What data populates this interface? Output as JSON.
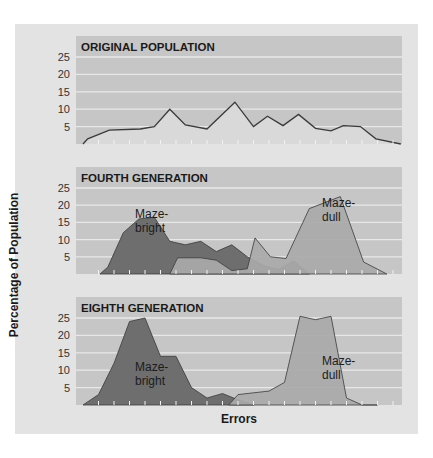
{
  "chart_data": {
    "type": "area",
    "ylabel": "Percentage of Population",
    "xlabel": "Errors",
    "ylim": [
      0,
      25
    ],
    "yticks": [
      5,
      10,
      15,
      20,
      25
    ],
    "grid": true,
    "colors": {
      "card_bg": "#e3e3e3",
      "panel_bg": "#c6c6c6",
      "panel_header_bg": "#c2c2c2",
      "gridline": "#e8e8e8",
      "maze_bright_fill": "#6e6e6e",
      "maze_dull_fill": "#a9a9a9",
      "original_fill": "#d9d9d9",
      "line": "#3a3a3a"
    },
    "panels": [
      {
        "title": "ORIGINAL POPULATION",
        "series": [
          {
            "name": "Original population",
            "style": "line",
            "x": [
              0,
              0.3,
              1.7,
              3.7,
              4.6,
              5.6,
              6.6,
              8,
              9.8,
              11,
              11.9,
              12.9,
              13.9,
              15,
              16,
              16.8,
              17.9,
              18.9,
              20.5
            ],
            "values": [
              0,
              1.5,
              4,
              4.3,
              5,
              10,
              5.5,
              4.3,
              12,
              5,
              8,
              5.3,
              8.5,
              4.5,
              3.8,
              5.3,
              5,
              1.5,
              0
            ]
          }
        ]
      },
      {
        "title": "FOURTH GENERATION",
        "series": [
          {
            "name": "Maze-bright",
            "label_lines": [
              "Maze-",
              "bright"
            ],
            "style": "area",
            "x": [
              1.1,
              1.6,
              2.6,
              3.6,
              4.6,
              5.6,
              6.6,
              7.6,
              8.6,
              9.6,
              10.6,
              11.6,
              12.6,
              13.6,
              14.6
            ],
            "values": [
              0,
              2,
              12,
              16,
              16.5,
              9.5,
              8.5,
              9.5,
              6.5,
              8.5,
              5,
              2.5,
              1.3,
              3.8,
              0
            ]
          },
          {
            "name": "Maze-dull",
            "label_lines": [
              "Maze-",
              "dull"
            ],
            "style": "area",
            "x": [
              5.6,
              6.1,
              7.6,
              8.6,
              9.6,
              10.6,
              11.1,
              12.1,
              13.1,
              14.6,
              16.6,
              18.1,
              19.6
            ],
            "values": [
              0,
              4.7,
              4.7,
              4,
              1,
              1.5,
              10.5,
              5,
              4.5,
              19,
              22.5,
              3.5,
              0
            ]
          }
        ]
      },
      {
        "title": "EIGHTH GENERATION",
        "series": [
          {
            "name": "Maze-bright",
            "label_lines": [
              "Maze-",
              "bright"
            ],
            "style": "area",
            "x": [
              0,
              1,
              2,
              3,
              4,
              5,
              6,
              7,
              8,
              9,
              10,
              11
            ],
            "values": [
              0,
              3,
              12,
              24,
              25,
              14,
              14,
              5,
              2,
              3.3,
              1.5,
              0
            ]
          },
          {
            "name": "Maze-dull",
            "label_lines": [
              "Maze-",
              "dull"
            ],
            "style": "area",
            "x": [
              9.4,
              10,
              11,
              12,
              13,
              14,
              15,
              16,
              17,
              18,
              19
            ],
            "values": [
              0,
              3,
              3.5,
              4,
              6.5,
              25.5,
              24.5,
              25.5,
              2,
              0,
              0
            ]
          }
        ]
      }
    ]
  }
}
